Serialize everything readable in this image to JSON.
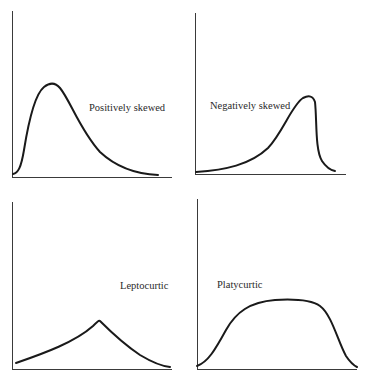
{
  "panels": [
    {
      "id": "positively-skewed",
      "label": "Positively skewed"
    },
    {
      "id": "negatively-skewed",
      "label": "Negatively skewed"
    },
    {
      "id": "leptocurtic",
      "label": "Leptocurtic"
    },
    {
      "id": "platycurtic",
      "label": "Platycurtic"
    }
  ],
  "colors": {
    "background": "#ffffff",
    "line": "#1a1a1a",
    "axis": "#3a3a3a"
  }
}
